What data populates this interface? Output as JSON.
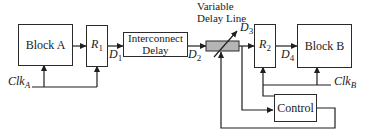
{
  "diagram": {
    "colors": {
      "line": "#1f1f1f",
      "box_border": "#2b2b2b",
      "box_fill": "#ffffff",
      "delay_element_fill": "#b5b5b5",
      "background": "#ffffff"
    },
    "boxes": {
      "block_a": {
        "label": "Block A"
      },
      "r1": {
        "base": "R",
        "sub": "1"
      },
      "interconnect_delay": {
        "line1": "Interconnect",
        "line2": "Delay"
      },
      "r2": {
        "base": "R",
        "sub": "2"
      },
      "block_b": {
        "label": "Block B"
      },
      "control": {
        "label": "Control"
      }
    },
    "captions": {
      "variable_delay_line": {
        "line1": "Variable",
        "line2": "Delay Line"
      }
    },
    "signals": {
      "d1": {
        "base": "D",
        "sub": "1"
      },
      "d2": {
        "base": "D",
        "sub": "2"
      },
      "d3": {
        "base": "D",
        "sub": "3"
      },
      "d4": {
        "base": "D",
        "sub": "4"
      },
      "clk_a": {
        "base": "Clk",
        "sub": "A"
      },
      "clk_b": {
        "base": "Clk",
        "sub": "B"
      }
    }
  }
}
